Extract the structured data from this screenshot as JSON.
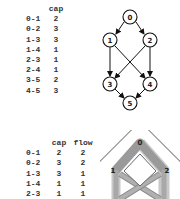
{
  "table1": {
    "headers": [
      "",
      "cap"
    ],
    "rows": [
      {
        "edge": "0-1",
        "cap": "2"
      },
      {
        "edge": "0-2",
        "cap": "3"
      },
      {
        "edge": "1-3",
        "cap": "3"
      },
      {
        "edge": "1-4",
        "cap": "1"
      },
      {
        "edge": "2-3",
        "cap": "1"
      },
      {
        "edge": "2-4",
        "cap": "1"
      },
      {
        "edge": "3-5",
        "cap": "2"
      },
      {
        "edge": "4-5",
        "cap": "3"
      }
    ]
  },
  "table2": {
    "headers": [
      "",
      "cap",
      "flow"
    ],
    "rows": [
      {
        "edge": "0-1",
        "cap": "2",
        "flow": "2"
      },
      {
        "edge": "0-2",
        "cap": "3",
        "flow": "2"
      },
      {
        "edge": "1-3",
        "cap": "3",
        "flow": "1"
      },
      {
        "edge": "1-4",
        "cap": "1",
        "flow": "1"
      },
      {
        "edge": "2-3",
        "cap": "1",
        "flow": "1"
      }
    ]
  },
  "graph1": {
    "nodes": [
      {
        "id": "0",
        "label": "0",
        "x": 30,
        "y": 17
      },
      {
        "id": "1",
        "label": "1",
        "x": 10,
        "y": 40
      },
      {
        "id": "2",
        "label": "2",
        "x": 50,
        "y": 40
      },
      {
        "id": "3",
        "label": "3",
        "x": 10,
        "y": 84
      },
      {
        "id": "4",
        "label": "4",
        "x": 50,
        "y": 84
      },
      {
        "id": "5",
        "label": "5",
        "x": 30,
        "y": 103
      }
    ],
    "edges": [
      [
        "0",
        "1"
      ],
      [
        "0",
        "2"
      ],
      [
        "1",
        "3"
      ],
      [
        "1",
        "4"
      ],
      [
        "2",
        "3"
      ],
      [
        "2",
        "4"
      ],
      [
        "3",
        "5"
      ],
      [
        "4",
        "5"
      ]
    ]
  },
  "graph2": {
    "nodes": [
      {
        "id": "0",
        "label": "0",
        "x": 40,
        "y": 13
      },
      {
        "id": "1",
        "label": "1",
        "x": 16,
        "y": 40
      },
      {
        "id": "2",
        "label": "2",
        "x": 64,
        "y": 40
      }
    ],
    "colors": {
      "flow": "#9a9a9a",
      "residual": "#c8c8c8",
      "outline": "#888888"
    }
  }
}
